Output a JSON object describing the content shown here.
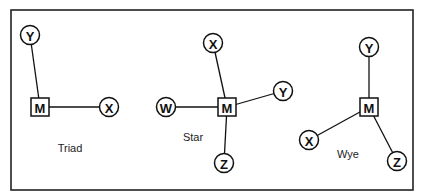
{
  "diagrams": [
    {
      "caption": "Triad",
      "caption_pos": [
        70,
        148
      ],
      "hub": {
        "label": "M",
        "x": 40,
        "y": 107
      },
      "nodes": [
        {
          "label": "Y",
          "x": 30,
          "y": 35
        },
        {
          "label": "X",
          "x": 109,
          "y": 107
        }
      ]
    },
    {
      "caption": "Star",
      "caption_pos": [
        193,
        137
      ],
      "hub": {
        "label": "M",
        "x": 227,
        "y": 107
      },
      "nodes": [
        {
          "label": "X",
          "x": 213,
          "y": 43
        },
        {
          "label": "Y",
          "x": 283,
          "y": 91
        },
        {
          "label": "W",
          "x": 166,
          "y": 107
        },
        {
          "label": "Z",
          "x": 224,
          "y": 163
        }
      ]
    },
    {
      "caption": "Wye",
      "caption_pos": [
        348,
        154
      ],
      "hub": {
        "label": "M",
        "x": 369,
        "y": 107
      },
      "nodes": [
        {
          "label": "Y",
          "x": 369,
          "y": 47
        },
        {
          "label": "X",
          "x": 309,
          "y": 140
        },
        {
          "label": "Z",
          "x": 397,
          "y": 161
        }
      ]
    }
  ]
}
